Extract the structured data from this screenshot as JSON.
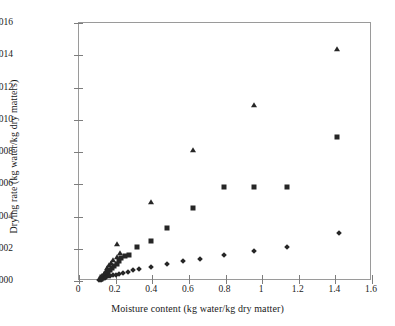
{
  "chart_data": {
    "type": "scatter",
    "title": "",
    "xlabel": "Moisture content (kg water/kg dry matter)",
    "ylabel": "Drying rate (kg water/kg dry matters)",
    "xlim": [
      0,
      1.6
    ],
    "ylim": [
      0,
      0.0016
    ],
    "xticks": [
      0,
      0.2,
      0.4,
      0.6,
      0.8,
      1,
      1.2,
      1.4,
      1.6
    ],
    "xticklabels": [
      "0",
      "0.2",
      "0.4",
      "0.6",
      "0.8",
      "1",
      "1.2",
      "1.4",
      "1.6"
    ],
    "yticks": [
      0,
      0.0002,
      0.0004,
      0.0006,
      0.0008,
      0.001,
      0.0012,
      0.0014,
      0.0016
    ],
    "yticklabels": [
      "0.0000",
      "0.0002",
      "0.0004",
      "0.0006",
      "0.0008",
      "0.0010",
      "0.0012",
      "0.0014",
      "0.0016"
    ],
    "grid": false,
    "legend": "none",
    "marker_color": "#262626",
    "series": [
      {
        "name": "triangle-series",
        "marker": "triangle",
        "points": [
          [
            0.115,
            1.8e-05
          ],
          [
            0.125,
            3e-05
          ],
          [
            0.135,
            4.5e-05
          ],
          [
            0.145,
            6.2e-05
          ],
          [
            0.155,
            8e-05
          ],
          [
            0.165,
            9.8e-05
          ],
          [
            0.175,
            0.000112
          ],
          [
            0.185,
            0.000128
          ],
          [
            0.205,
            0.00015
          ],
          [
            0.225,
            0.000175
          ],
          [
            0.205,
            0.000232
          ],
          [
            0.395,
            0.000493
          ],
          [
            0.625,
            0.00081
          ],
          [
            0.955,
            0.00109
          ],
          [
            1.41,
            0.00144
          ]
        ]
      },
      {
        "name": "square-series",
        "marker": "square",
        "points": [
          [
            0.118,
            1.2e-05
          ],
          [
            0.128,
            2.2e-05
          ],
          [
            0.138,
            3.4e-05
          ],
          [
            0.148,
            4.6e-05
          ],
          [
            0.158,
            5.8e-05
          ],
          [
            0.168,
            7e-05
          ],
          [
            0.178,
            8.2e-05
          ],
          [
            0.19,
            9.5e-05
          ],
          [
            0.205,
            0.000108
          ],
          [
            0.218,
            0.000122
          ],
          [
            0.232,
            0.00014
          ],
          [
            0.25,
            0.000158
          ],
          [
            0.272,
            0.000162
          ],
          [
            0.315,
            0.000212
          ],
          [
            0.395,
            0.000248
          ],
          [
            0.48,
            0.00033
          ],
          [
            0.625,
            0.000455
          ],
          [
            0.79,
            0.000585
          ],
          [
            0.955,
            0.00058
          ],
          [
            1.135,
            0.000582
          ],
          [
            1.41,
            0.000895
          ]
        ]
      },
      {
        "name": "diamond-series",
        "marker": "diamond",
        "points": [
          [
            0.11,
            4e-06
          ],
          [
            0.118,
            8e-06
          ],
          [
            0.126,
            1.2e-05
          ],
          [
            0.134,
            1.6e-05
          ],
          [
            0.142,
            2e-05
          ],
          [
            0.15,
            2.4e-05
          ],
          [
            0.16,
            2.8e-05
          ],
          [
            0.172,
            3.2e-05
          ],
          [
            0.185,
            3.6e-05
          ],
          [
            0.2,
            4e-05
          ],
          [
            0.218,
            4.6e-05
          ],
          [
            0.24,
            5.2e-05
          ],
          [
            0.265,
            5.8e-05
          ],
          [
            0.295,
            6.6e-05
          ],
          [
            0.33,
            7.4e-05
          ],
          [
            0.395,
            8.8e-05
          ],
          [
            0.48,
            0.000105
          ],
          [
            0.57,
            0.000122
          ],
          [
            0.66,
            0.000138
          ],
          [
            0.79,
            0.00016
          ],
          [
            0.955,
            0.000185
          ],
          [
            1.135,
            0.000212
          ],
          [
            1.42,
            0.000298
          ]
        ]
      }
    ]
  }
}
